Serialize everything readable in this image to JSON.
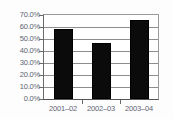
{
  "chart_data": {
    "type": "bar",
    "title": "",
    "subtitle": "",
    "xlabel": "",
    "ylabel": "",
    "categories": [
      "2001–02",
      "2002–03",
      "2003–04"
    ],
    "values": [
      58.0,
      46.5,
      66.0
    ],
    "series": [
      {
        "name": "",
        "values": [
          58.0,
          46.5,
          66.0
        ]
      }
    ],
    "ylim": [
      0.0,
      70.0
    ],
    "ytick_values": [
      0.0,
      10.0,
      20.0,
      30.0,
      40.0,
      50.0,
      60.0,
      70.0
    ],
    "ytick_labels": [
      "0.0%",
      "10.0%",
      "20.0%",
      "30.0%",
      "40.0%",
      "50.0%",
      "60.0%",
      "70.0%"
    ],
    "grid": true,
    "grid_axis": "y",
    "legend": false,
    "legend_position": "none",
    "bar_color": "#0b0b0b",
    "grid_color": "#8d8d8d",
    "axis_color": "#6a6a6a",
    "tick_label_color": "#5d6472",
    "background_color": "#ffffff",
    "value_labels_shown": false,
    "annotations": []
  }
}
